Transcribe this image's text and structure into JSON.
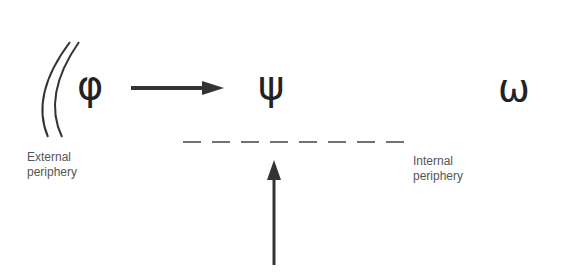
{
  "diagram": {
    "symbols": {
      "phi": "φ",
      "psi": "ψ",
      "omega": "ω"
    },
    "labels": {
      "external_line1": "External",
      "external_line2": "periphery",
      "internal_line1": "Internal",
      "internal_line2": "periphery"
    },
    "colors": {
      "ink": "#222222",
      "text": "#555555"
    }
  }
}
